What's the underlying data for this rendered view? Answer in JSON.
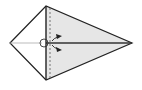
{
  "diagram": {
    "type": "origami-fold-step",
    "shape": "kite",
    "colors": {
      "background": "#ffffff",
      "fill_right": "#e6e6e6",
      "fill_left": "#ffffff",
      "stroke": "#222222",
      "center_line": "#333333",
      "left_line": "#aaaaaa",
      "dashed": "#666666"
    },
    "elements": [
      {
        "name": "kite-outline",
        "description": "kite shape outline"
      },
      {
        "name": "vertical-fold-edge",
        "description": "solid vertical edge"
      },
      {
        "name": "valley-fold-line",
        "description": "dashed fold line"
      },
      {
        "name": "center-crease",
        "description": "horizontal center crease"
      },
      {
        "name": "pivot-circle-icon",
        "description": "circle at center point"
      },
      {
        "name": "fold-arrow-icon",
        "description": "arrows indicating fold direction"
      }
    ]
  }
}
